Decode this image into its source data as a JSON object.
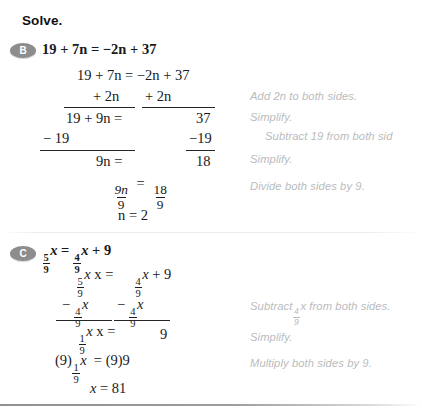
{
  "heading": "Solve.",
  "sections": [
    {
      "badge": "B",
      "problem": "19 + 7n = −2n + 37",
      "lines": [
        "19 + 7n = −2n + 37",
        "+ 2n",
        "+ 2n",
        "19 + 9n =",
        "37",
        "− 19",
        "−19",
        "9n =",
        "18",
        "n = 2"
      ],
      "fraction_rows": [
        {
          "left_num": "9n",
          "left_den": "9",
          "right_num": "18",
          "right_den": "9"
        }
      ],
      "notes": [
        "Add 2n to both sides.",
        "Simplify.",
        "Subtract 19 from both sid",
        "Simplify.",
        "Divide both sides by 9."
      ]
    },
    {
      "badge": "C",
      "problem_num": "5",
      "problem_den": "9",
      "problem_tail": "x =",
      "problem_num2": "4",
      "problem_den2": "9",
      "problem_tail2": "x + 9",
      "lines": [
        "x =",
        "x + 9",
        "x =",
        "9",
        "(9)",
        "x = (9)9",
        "x = 81"
      ],
      "notes": [
        "Subtract",
        "x from both sides.",
        "Simplify.",
        "Multiply both sides by 9."
      ],
      "note_frac_num": "4",
      "note_frac_den": "9"
    }
  ],
  "colors": {
    "text": "#18191b",
    "note": "#b9bbbd",
    "badge": "#8d8d8d",
    "rule": "#222426"
  }
}
